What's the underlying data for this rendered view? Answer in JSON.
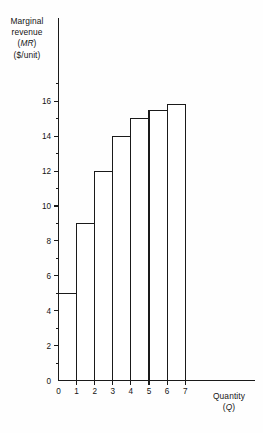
{
  "chart_data": {
    "type": "bar",
    "title": "",
    "subtitle": "",
    "categories": [
      "1",
      "2",
      "3",
      "4",
      "5",
      "6",
      "7"
    ],
    "values": [
      5,
      9,
      12,
      14,
      15,
      15.5,
      15.8
    ],
    "series": [
      {
        "name": "Marginal revenue",
        "values": [
          5,
          9,
          12,
          14,
          15,
          15.5,
          15.8
        ]
      }
    ],
    "x": [
      1,
      2,
      3,
      4,
      5,
      6,
      7
    ],
    "xlabel": "Quantity (Q)",
    "ylabel": "Marginal revenue (MR) ($/unit)",
    "xlim": [
      0,
      8.6
    ],
    "ylim": [
      0,
      17.4
    ],
    "x_major_ticks": [
      0,
      1,
      2,
      3,
      4,
      5,
      6,
      7
    ],
    "x_tick_labels": [
      "0",
      "1",
      "2",
      "3",
      "4",
      "5",
      "6",
      "7"
    ],
    "y_major_ticks": [
      0,
      2,
      4,
      6,
      8,
      10,
      12,
      14,
      16
    ],
    "y_tick_labels": [
      "0",
      "2",
      "4",
      "6",
      "8",
      "10",
      "12",
      "14",
      "16"
    ],
    "y_minor_ticks": [
      1,
      3,
      5,
      7,
      9,
      11,
      13,
      15,
      17
    ],
    "grid": false,
    "legend": false,
    "bar_fill": "#ffffff",
    "bar_stroke": "#1a1a1a",
    "axis_color": "#1a1a1a",
    "background": "#fefefe",
    "bar_width_units": 1
  },
  "y_axis": {
    "line1": "Marginal",
    "line2": "revenue",
    "line3_paren_open": "(",
    "line3_symbol": "MR",
    "line3_paren_close": ")",
    "line4": "($/unit)"
  },
  "x_axis": {
    "line1": "Quantity",
    "line2_paren_open": "(",
    "line2_symbol": "Q",
    "line2_paren_close": ")"
  }
}
